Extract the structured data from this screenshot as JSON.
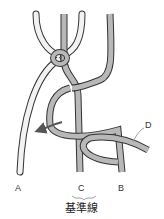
{
  "diagram": {
    "labels": {
      "a": "A",
      "b": "B",
      "c": "C",
      "d": "D"
    },
    "caption": "基準線",
    "colors": {
      "cord_light": "#f2f2f2",
      "cord_gray": "#b8b8b8",
      "outline": "#333333",
      "bracket": "#9aa0a6"
    }
  }
}
